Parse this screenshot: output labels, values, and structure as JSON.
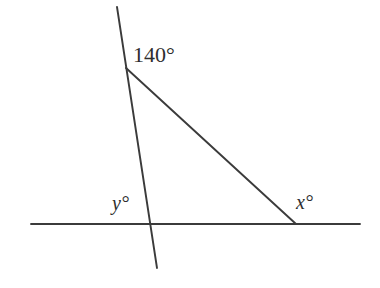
{
  "figure": {
    "background_color": "#ffffff",
    "stroke_color": "#3b3b3b",
    "width": 380,
    "height": 288
  },
  "labels": {
    "vertex_angle": "140°",
    "angle_y": "y°",
    "angle_x": "x°"
  },
  "chart_data": {
    "type": "diagram",
    "segments": [
      {
        "name": "horizontal-baseline",
        "x1": 31,
        "y1": 224,
        "x2": 360,
        "y2": 224
      },
      {
        "name": "steep-transversal",
        "x1": 117,
        "y1": 7,
        "x2": 157,
        "y2": 268
      },
      {
        "name": "diagonal-hypotenuse",
        "x1": 126,
        "y1": 68,
        "x2": 296,
        "y2": 224
      }
    ],
    "points": [
      {
        "name": "apex-vertex",
        "x": 126,
        "y": 68,
        "label": "140°"
      },
      {
        "name": "y-intersection",
        "x": 148,
        "y": 224,
        "label": "y°"
      },
      {
        "name": "x-intersection",
        "x": 296,
        "y": 224,
        "label": "x°"
      }
    ],
    "annotations": [
      {
        "text": "140°",
        "x": 133,
        "y": 44
      },
      {
        "text": "y°",
        "x": 112,
        "y": 193
      },
      {
        "text": "x°",
        "x": 296,
        "y": 192
      }
    ]
  }
}
